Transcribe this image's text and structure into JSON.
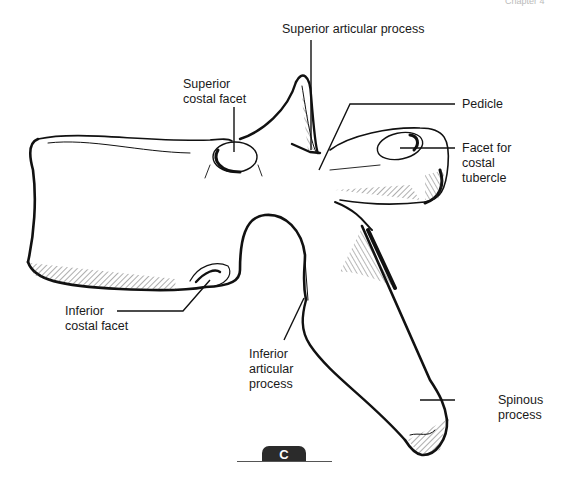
{
  "header": {
    "running_head": "Chapter 4"
  },
  "figure": {
    "panel_letter": "C",
    "labels": [
      {
        "id": "superior-articular-process",
        "text": "Superior articular process"
      },
      {
        "id": "superior-costal-facet",
        "text": "Superior\ncostal facet"
      },
      {
        "id": "pedicle",
        "text": "Pedicle"
      },
      {
        "id": "facet-for-costal-tubercle",
        "text": "Facet for\ncostal\ntubercle"
      },
      {
        "id": "inferior-costal-facet",
        "text": "Inferior\ncostal facet"
      },
      {
        "id": "inferior-articular-process",
        "text": "Inferior\narticular\nprocess"
      },
      {
        "id": "spinous-process",
        "text": "Spinous\nprocess"
      }
    ]
  }
}
